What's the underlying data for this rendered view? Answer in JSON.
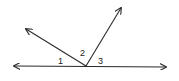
{
  "diagram": {
    "type": "angles-on-a-line",
    "stroke_color": "#2a2a2a",
    "background": "#ffffff",
    "vertex": {
      "x": 86,
      "y": 66
    },
    "line": {
      "left_tip": {
        "x": 14,
        "y": 66
      },
      "right_tip": {
        "x": 166,
        "y": 67
      }
    },
    "rays": [
      {
        "name": "left-ray",
        "tip": {
          "x": 26,
          "y": 29
        }
      },
      {
        "name": "upper-ray",
        "tip": {
          "x": 121,
          "y": 8
        }
      }
    ],
    "labels": [
      {
        "text": "1",
        "x": 58,
        "y": 64
      },
      {
        "text": "2",
        "x": 80,
        "y": 56
      },
      {
        "text": "3",
        "x": 98,
        "y": 64
      }
    ]
  }
}
